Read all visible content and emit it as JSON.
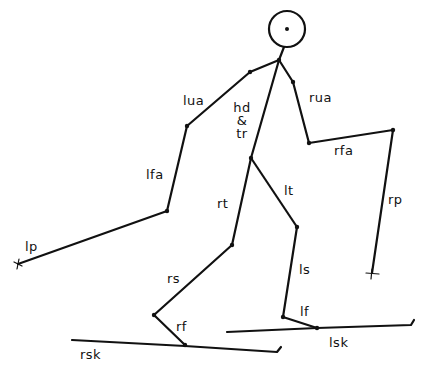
{
  "diagram": {
    "colors": {
      "line": "#111111",
      "background": "#ffffff"
    },
    "head": {
      "cx": 287,
      "cy": 29,
      "r": 18
    },
    "joints": {
      "neck": [
        279,
        60
      ],
      "l_shoulder": [
        250,
        72
      ],
      "l_elbow": [
        187,
        126
      ],
      "l_wrist": [
        167,
        211
      ],
      "l_pole_tip": [
        18,
        264
      ],
      "r_shoulder": [
        293,
        82
      ],
      "r_elbow": [
        309,
        143
      ],
      "r_wrist": [
        393,
        130
      ],
      "r_pole_tip": [
        372,
        273
      ],
      "hip": [
        251,
        158
      ],
      "r_knee": [
        232,
        245
      ],
      "r_ankle": [
        154,
        315
      ],
      "r_toe": [
        185,
        345
      ],
      "l_knee": [
        297,
        227
      ],
      "l_ankle": [
        283,
        317
      ],
      "l_toe": [
        317,
        328
      ]
    },
    "segments": [
      {
        "id": "hd-tr-neck",
        "from": "neck",
        "to": "hip"
      },
      {
        "id": "lua",
        "from": "neck",
        "to": "l_shoulder"
      },
      {
        "id": "lua-seg",
        "from": "l_shoulder",
        "to": "l_elbow"
      },
      {
        "id": "lfa",
        "from": "l_elbow",
        "to": "l_wrist"
      },
      {
        "id": "lp",
        "from": "l_wrist",
        "to": "l_pole_tip"
      },
      {
        "id": "rua-top",
        "from": "neck",
        "to": "r_shoulder"
      },
      {
        "id": "rua",
        "from": "r_shoulder",
        "to": "r_elbow"
      },
      {
        "id": "rfa",
        "from": "r_elbow",
        "to": "r_wrist"
      },
      {
        "id": "rp",
        "from": "r_wrist",
        "to": "r_pole_tip"
      },
      {
        "id": "rt",
        "from": "hip",
        "to": "r_knee"
      },
      {
        "id": "rs",
        "from": "r_knee",
        "to": "r_ankle"
      },
      {
        "id": "rf",
        "from": "r_ankle",
        "to": "r_toe"
      },
      {
        "id": "lt",
        "from": "hip",
        "to": "l_knee"
      },
      {
        "id": "ls",
        "from": "l_knee",
        "to": "l_ankle"
      },
      {
        "id": "lf",
        "from": "l_ankle",
        "to": "l_toe"
      }
    ],
    "skis": [
      {
        "id": "rsk",
        "from": [
          72,
          340
        ],
        "to": [
          277,
          352
        ],
        "hook": [
          281,
          347
        ]
      },
      {
        "id": "lsk",
        "from": [
          227,
          332
        ],
        "to": [
          411,
          325
        ],
        "hook": [
          414,
          320
        ]
      }
    ],
    "labels": {
      "lua": "lua",
      "hd": "hd",
      "amp": "&",
      "tr": "tr",
      "rua": "rua",
      "rfa": "rfa",
      "lfa": "lfa",
      "rt": "rt",
      "lt": "lt",
      "rp": "rp",
      "lp": "lp",
      "rs": "rs",
      "ls": "ls",
      "rf": "rf",
      "lf": "lf",
      "rsk": "rsk",
      "lsk": "lsk"
    }
  }
}
